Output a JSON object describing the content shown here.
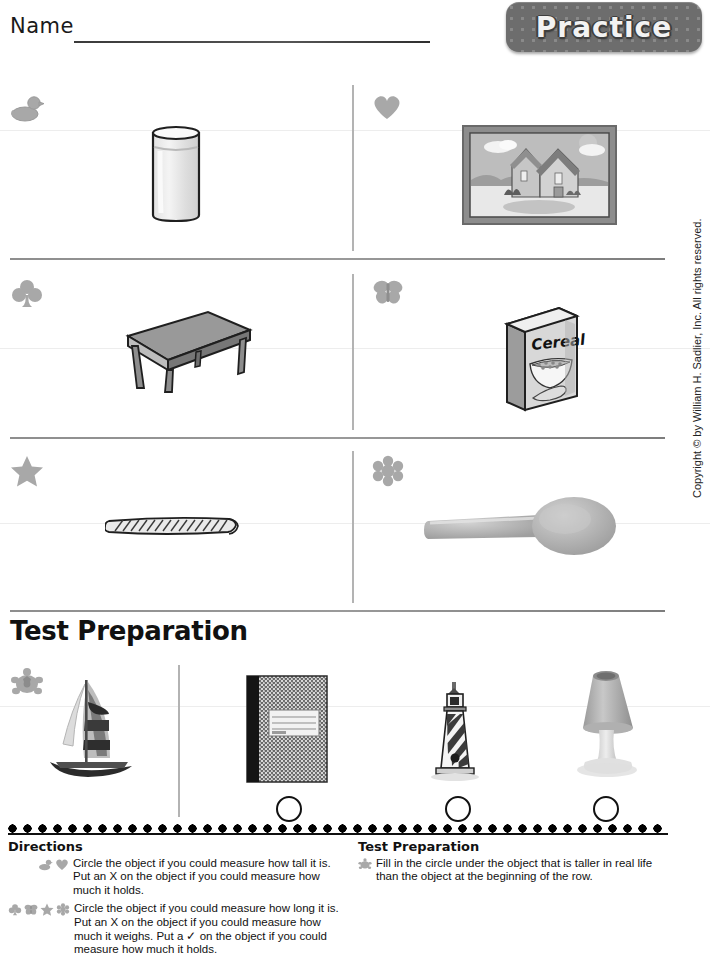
{
  "header": {
    "name_label": "Name",
    "badge_label": "Practice",
    "badge_color": "#6d6d6d"
  },
  "copyright": "Copyright © by William H. Sadlier, Inc. All rights reserved.",
  "section_title": "Test Preparation",
  "rows": [
    {
      "left": {
        "marker_icon": "duck-icon",
        "object": "glass-of-water"
      },
      "right": {
        "marker_icon": "heart-icon",
        "object": "framed-house-picture"
      }
    },
    {
      "left": {
        "marker_icon": "club-icon",
        "object": "table"
      },
      "right": {
        "marker_icon": "butterfly-icon",
        "object": "cereal-box",
        "object_label": "Cereal"
      }
    },
    {
      "left": {
        "marker_icon": "star-icon",
        "object": "rope"
      },
      "right": {
        "marker_icon": "flower-icon",
        "object": "spoon"
      }
    }
  ],
  "test_prep_row": {
    "marker_icon": "turtle-icon",
    "reference_object": "sailboat",
    "choices": [
      {
        "object": "composition-notebook",
        "has_circle": true
      },
      {
        "object": "lighthouse",
        "has_circle": true
      },
      {
        "object": "table-lamp",
        "has_circle": true
      }
    ]
  },
  "footer": {
    "directions_heading": "Directions",
    "directions": [
      {
        "icons": [
          "duck-icon",
          "heart-icon"
        ],
        "text": "Circle the object if you could measure how tall it is. Put an X on the object if you could measure how much it holds."
      },
      {
        "icons": [
          "club-icon",
          "butterfly-icon",
          "star-icon",
          "flower-icon"
        ],
        "text": "Circle the object if you could measure how long it is. Put an X on the object if you could measure how much it weighs. Put a ✓ on the object if you could measure how much it holds."
      }
    ],
    "test_prep_heading": "Test Preparation",
    "test_prep_directions": [
      {
        "icons": [
          "turtle-icon"
        ],
        "text": "Fill in the circle under the object that is taller in real life than the object at the beginning of the row."
      }
    ]
  }
}
